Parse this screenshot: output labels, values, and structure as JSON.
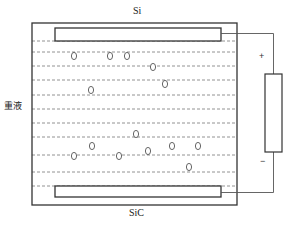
{
  "diagram": {
    "type": "electrostatic-separation-schematic",
    "labels": {
      "top_electrode": "Si",
      "bottom_electrode": "SiC",
      "liquid": "重液",
      "positive": "+",
      "negative": "−"
    },
    "colors": {
      "stroke": "#333333",
      "dashed": "#777777",
      "background": "#ffffff"
    },
    "container": {
      "x": 32,
      "y": 23,
      "width": 205,
      "height": 182
    },
    "top_electrode": {
      "x": 55,
      "y": 28,
      "width": 166,
      "height": 13
    },
    "bottom_electrode": {
      "x": 55,
      "y": 186,
      "width": 166,
      "height": 11
    },
    "dashed_lines_y": [
      41,
      52,
      66,
      80,
      95,
      109,
      123,
      137,
      155,
      172,
      186
    ],
    "power_supply": {
      "x": 265,
      "y": 74,
      "width": 17,
      "height": 78
    },
    "particles": [
      {
        "x": 74,
        "y": 56
      },
      {
        "x": 110,
        "y": 56
      },
      {
        "x": 127,
        "y": 56
      },
      {
        "x": 153,
        "y": 67
      },
      {
        "x": 165,
        "y": 84
      },
      {
        "x": 91,
        "y": 90
      },
      {
        "x": 136,
        "y": 134
      },
      {
        "x": 92,
        "y": 146
      },
      {
        "x": 172,
        "y": 146
      },
      {
        "x": 198,
        "y": 146
      },
      {
        "x": 74,
        "y": 156
      },
      {
        "x": 119,
        "y": 156
      },
      {
        "x": 148,
        "y": 151
      },
      {
        "x": 189,
        "y": 167
      }
    ]
  }
}
